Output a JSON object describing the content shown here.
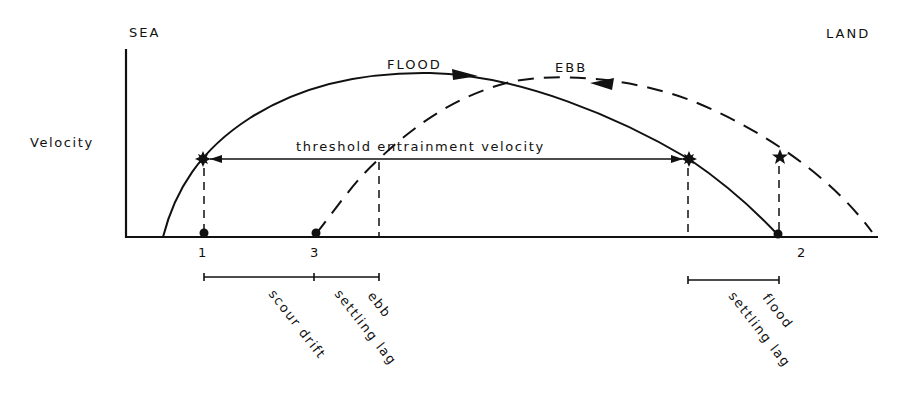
{
  "diagram": {
    "title_left": "SEA",
    "title_right": "LAND",
    "y_axis_label": "Velocity",
    "threshold_label": "threshold entrainment velocity",
    "curves": {
      "flood": {
        "label": "FLOOD",
        "style": "solid",
        "direction": "landward"
      },
      "ebb": {
        "label": "EBB",
        "style": "dashed",
        "direction": "seaward"
      }
    },
    "points": [
      {
        "id": "1",
        "label": "1"
      },
      {
        "id": "3",
        "label": "3"
      },
      {
        "id": "2",
        "label": "2"
      }
    ],
    "intervals": [
      {
        "label": "scour drift",
        "from": "1",
        "to": "3"
      },
      {
        "label_line1": "ebb",
        "label_line2": "settling lag",
        "from": "3",
        "to": "ebb threshold"
      },
      {
        "label_line1": "flood",
        "label_line2": "settling lag",
        "from": "flood threshold",
        "to": "2"
      }
    ],
    "colors": {
      "ink": "#111111",
      "background": "#ffffff"
    }
  }
}
